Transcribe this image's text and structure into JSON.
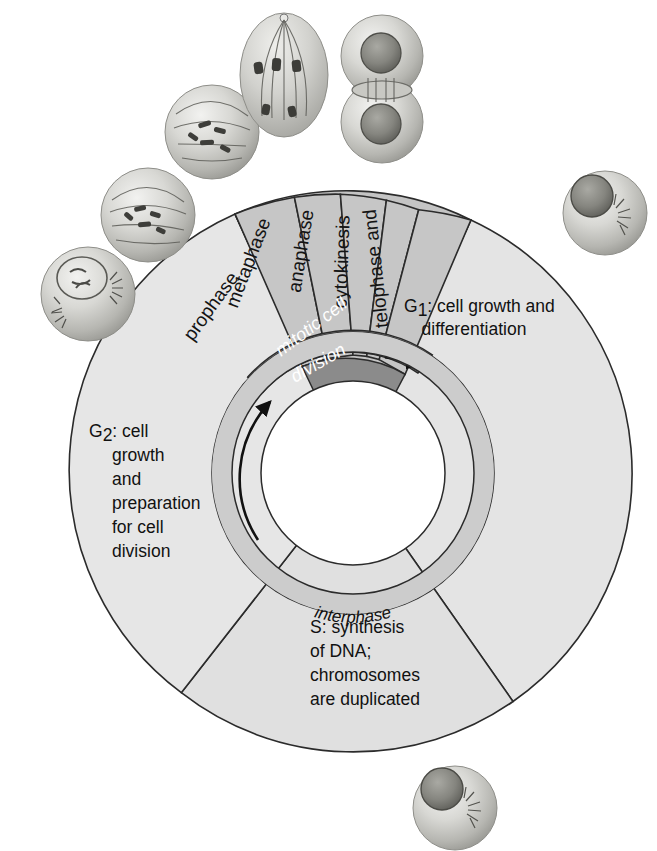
{
  "diagram": {
    "background_color": "#ffffff",
    "colors": {
      "interphase_sector_fill": "#e3e3e3",
      "mitotic_phase_fill": "#c3c3c3",
      "mitotic_band_fill": "#8d8d8d",
      "inner_ring_fill": "#cfcfcf",
      "hub_fill": "#ffffff",
      "outline": "#2b2b2b",
      "text": "#111111",
      "mitotic_band_text": "#ffffff"
    },
    "geometry": {
      "center_x": 353,
      "center_y": 473,
      "outer_radius": 279,
      "mitotic_inner_radius": 118,
      "band_inner_radius": 92,
      "ring_outer_radius": 140,
      "ring_inner_radius": 122,
      "hub_radius": 92
    }
  },
  "interphase_sectors": [
    {
      "id": "g1",
      "name": "G1 phase",
      "label_lines": [
        "G",
        "1",
        ": cell growth and",
        "differentiation"
      ],
      "label_main": "G",
      "label_subscript": "1",
      "label_rest": ": cell growth and",
      "label_line2": "differentiation",
      "start_angle_deg": -65,
      "end_angle_deg": 55
    },
    {
      "id": "s",
      "name": "S phase",
      "label_main": "S: synthesis",
      "label_line2": "of DNA;",
      "label_line3": "chromosomes",
      "label_line4": "are duplicated",
      "start_angle_deg": 55,
      "end_angle_deg": 128
    },
    {
      "id": "g2",
      "name": "G2 phase",
      "label_main": "G",
      "label_subscript": "2",
      "label_rest": ": cell",
      "label_line2": "growth",
      "label_line3": "and",
      "label_line4": "preparation",
      "label_line5": "for cell",
      "label_line6": "division",
      "start_angle_deg": 128,
      "end_angle_deg": 245
    }
  ],
  "mitotic_phases": [
    {
      "id": "prophase",
      "label": "prophase"
    },
    {
      "id": "metaphase",
      "label": "metaphase"
    },
    {
      "id": "anaphase",
      "label": "anaphase"
    },
    {
      "id": "cytokinesis_part",
      "label": "cytokinesis"
    },
    {
      "id": "telophase_part",
      "label": "telophase and"
    }
  ],
  "bands": {
    "mitotic_band_line1": "mitotic cell",
    "mitotic_band_line2": "division",
    "interphase_label": "interphase"
  },
  "cell_illustrations": [
    {
      "id": "cell-prophase-early",
      "name": "prophase-cell",
      "position": "left"
    },
    {
      "id": "cell-prophase",
      "name": "prophase-cell-2",
      "position": "upper-left"
    },
    {
      "id": "cell-metaphase",
      "name": "metaphase-cell",
      "position": "top-left"
    },
    {
      "id": "cell-anaphase",
      "name": "anaphase-cell",
      "position": "top"
    },
    {
      "id": "cell-telophase",
      "name": "telophase-cytokinesis-cell",
      "position": "top-right"
    },
    {
      "id": "cell-g1",
      "name": "g1-interphase-cell",
      "position": "right"
    },
    {
      "id": "cell-s",
      "name": "s-phase-cell",
      "position": "bottom"
    }
  ]
}
